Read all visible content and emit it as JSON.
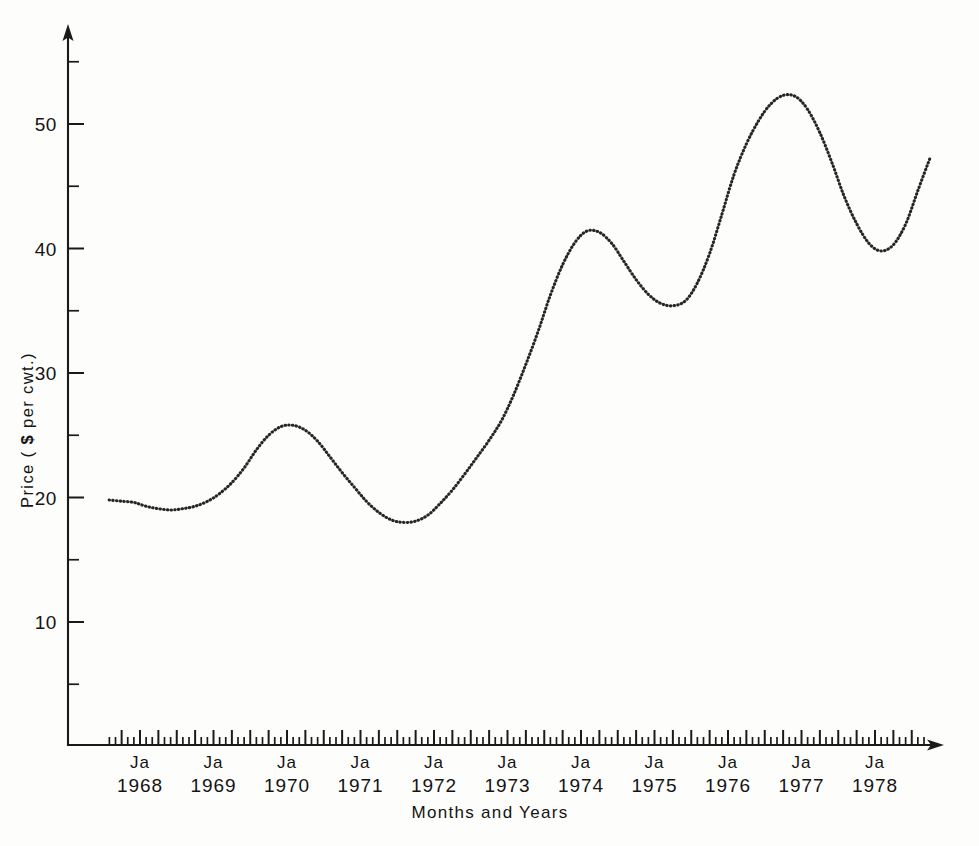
{
  "chart_data": {
    "type": "line",
    "title": "",
    "xlabel": "Months and Years",
    "ylabel": "Price ( $ per cwt.)",
    "ylabel_parts": {
      "prefix": "Price ( ",
      "currency": "$",
      "suffix": " per cwt.)"
    },
    "grid": false,
    "legend": "none",
    "line_style": "dotted",
    "line_color": "#262626",
    "background_color": "#fdfdfb",
    "axis_color": "#1a1a18",
    "ylim": [
      0,
      57
    ],
    "y_major_ticks": [
      10,
      20,
      30,
      40,
      50
    ],
    "y_major_tick_labels": [
      "10",
      "20",
      "30",
      "40",
      "50"
    ],
    "y_minor_ticks": [
      5,
      15,
      25,
      35,
      45,
      55
    ],
    "x_tick_interval": "monthly",
    "x_major_tick_interval": "quarterly",
    "xlim": [
      "1967-07",
      "1978-10"
    ],
    "x_axis_labels": [
      {
        "month": "Ja",
        "year": "1968"
      },
      {
        "month": "Ja",
        "year": "1969"
      },
      {
        "month": "Ja",
        "year": "1970"
      },
      {
        "month": "Ja",
        "year": "1971"
      },
      {
        "month": "Ja",
        "year": "1972"
      },
      {
        "month": "Ja",
        "year": "1973"
      },
      {
        "month": "Ja",
        "year": "1974"
      },
      {
        "month": "Ja",
        "year": "1975"
      },
      {
        "month": "Ja",
        "year": "1976"
      },
      {
        "month": "Ja",
        "year": "1977"
      },
      {
        "month": "Ja",
        "year": "1978"
      }
    ],
    "x": [
      1967.58,
      1967.75,
      1967.92,
      1968.08,
      1968.25,
      1968.42,
      1968.58,
      1968.75,
      1968.92,
      1969.08,
      1969.25,
      1969.42,
      1969.58,
      1969.75,
      1969.92,
      1970.08,
      1970.25,
      1970.42,
      1970.58,
      1970.75,
      1970.92,
      1971.08,
      1971.25,
      1971.42,
      1971.58,
      1971.75,
      1971.92,
      1972.08,
      1972.25,
      1972.42,
      1972.58,
      1972.75,
      1972.92,
      1973.08,
      1973.25,
      1973.42,
      1973.58,
      1973.75,
      1973.92,
      1974.08,
      1974.25,
      1974.42,
      1974.58,
      1974.75,
      1974.92,
      1975.08,
      1975.25,
      1975.42,
      1975.58,
      1975.75,
      1975.92,
      1976.08,
      1976.25,
      1976.42,
      1976.58,
      1976.75,
      1976.92,
      1977.08,
      1977.25,
      1977.42,
      1977.58,
      1977.75,
      1977.92,
      1978.08,
      1978.25,
      1978.42,
      1978.58,
      1978.75
    ],
    "values": [
      19.8,
      19.7,
      19.6,
      19.3,
      19.1,
      19.0,
      19.1,
      19.3,
      19.7,
      20.3,
      21.2,
      22.4,
      23.8,
      25.0,
      25.7,
      25.8,
      25.4,
      24.5,
      23.3,
      22.0,
      20.8,
      19.7,
      18.8,
      18.2,
      18.0,
      18.1,
      18.6,
      19.5,
      20.6,
      21.9,
      23.2,
      24.6,
      26.2,
      28.2,
      30.7,
      33.4,
      36.2,
      38.7,
      40.5,
      41.4,
      41.3,
      40.4,
      39.0,
      37.5,
      36.3,
      35.6,
      35.4,
      35.8,
      37.2,
      39.6,
      42.8,
      45.9,
      48.4,
      50.3,
      51.6,
      52.3,
      52.2,
      51.2,
      49.3,
      46.8,
      44.2,
      42.0,
      40.4,
      39.8,
      40.3,
      42.0,
      44.6,
      47.3
    ],
    "series_notes": [
      {
        "label": "start",
        "x": "1967-07",
        "value": 19.8
      },
      {
        "label": "local-min",
        "x": "1968-07",
        "value": 19.0
      },
      {
        "label": "local-max",
        "x": "1969-11",
        "value": 25.8
      },
      {
        "label": "local-min",
        "x": "1971-08",
        "value": 18.0
      },
      {
        "label": "local-max",
        "x": "1974-02",
        "value": 41.5
      },
      {
        "label": "local-min",
        "x": "1975-04",
        "value": 35.4
      },
      {
        "label": "global-max",
        "x": "1976-09",
        "value": 52.3
      },
      {
        "label": "local-min",
        "x": "1978-01",
        "value": 39.8
      },
      {
        "label": "local-max",
        "x": "1978-09",
        "value": 49.8
      },
      {
        "label": "end",
        "x": "1978-10",
        "value": 49.0
      }
    ]
  },
  "axes": {
    "y_title": "Price ( $ per cwt.)",
    "x_title": "Months and Years",
    "y_arrow": "up-arrow-icon",
    "x_arrow": "right-arrow-icon"
  }
}
